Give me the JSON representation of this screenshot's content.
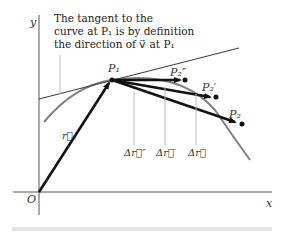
{
  "diagram": {
    "axes": {
      "x_label": "x",
      "y_label": "y",
      "origin_label": "O"
    },
    "caption_lines": [
      "The tangent to the",
      "curve at P₁ is by definition",
      "the direction of v⃗ at P₁"
    ],
    "points": {
      "p1": "P₁",
      "p2_double_prime": "P₂″",
      "p2_prime": "P₂′",
      "p2": "P₂"
    },
    "vectors": {
      "r1": "r⃗₁",
      "dr_double_prime": "Δr⃗″",
      "dr_prime": "Δr⃗′",
      "dr": "Δr⃗"
    },
    "colors": {
      "curve": "#808080",
      "vector": "#111111",
      "tangent": "#444444"
    }
  }
}
